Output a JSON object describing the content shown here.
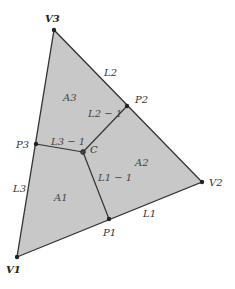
{
  "diagram": {
    "fill_color": "#c8c8c8",
    "edge_color": "#333333",
    "vertices": [
      {
        "id": "V1",
        "label": "V1",
        "x": 17,
        "y": 257,
        "lx": 6,
        "ly": 273
      },
      {
        "id": "V2",
        "label": "V2",
        "x": 202,
        "y": 182,
        "lx": 209,
        "ly": 186
      },
      {
        "id": "V3",
        "label": "V3",
        "x": 54,
        "y": 30,
        "lx": 45,
        "ly": 22
      }
    ],
    "points": [
      {
        "id": "P1",
        "label": "P1",
        "x": 109,
        "y": 219,
        "lx": 103,
        "ly": 236
      },
      {
        "id": "P2",
        "label": "P2",
        "x": 127,
        "y": 106,
        "lx": 135,
        "ly": 103
      },
      {
        "id": "P3",
        "label": "P3",
        "x": 36,
        "y": 144,
        "lx": 16,
        "ly": 148
      },
      {
        "id": "C",
        "label": "C",
        "x": 83,
        "y": 152,
        "lx": 90,
        "ly": 153
      }
    ],
    "edge_labels": [
      {
        "label": "L1",
        "x": 143,
        "y": 217
      },
      {
        "label": "L2",
        "x": 104,
        "y": 76
      },
      {
        "label": "L3",
        "x": 13,
        "y": 192
      }
    ],
    "segment_labels": [
      {
        "label": "L1 − 1",
        "x": 98,
        "y": 181
      },
      {
        "label": "L2 − 1",
        "x": 88,
        "y": 117
      },
      {
        "label": "L3 − 1",
        "x": 51,
        "y": 145
      }
    ],
    "area_labels": [
      {
        "label": "A1",
        "x": 54,
        "y": 201
      },
      {
        "label": "A2",
        "x": 135,
        "y": 166
      },
      {
        "label": "A3",
        "x": 63,
        "y": 101
      }
    ]
  }
}
